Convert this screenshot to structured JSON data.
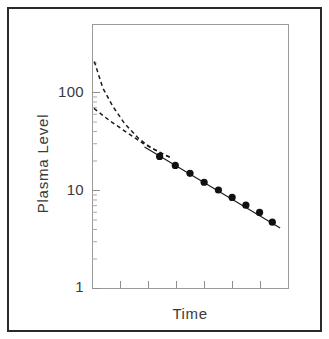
{
  "figure": {
    "border_color": "#2a2a2a",
    "background": "#ffffff"
  },
  "axis": {
    "y_tick_labels": [
      "100",
      "10",
      "1"
    ],
    "y_title": "Plasma  Level",
    "x_title": "Time"
  },
  "chart_data": {
    "type": "line",
    "title": "",
    "subtitle": "",
    "xlabel": "Time",
    "ylabel": "Plasma  Level",
    "xscale": "linear",
    "yscale": "log",
    "ylim": [
      1,
      300
    ],
    "xlim": [
      0,
      1
    ],
    "y_tick_labels": [
      "1",
      "10",
      "100"
    ],
    "y_ticks": [
      1,
      10,
      100
    ],
    "y_minor_ticks": [
      2,
      3,
      4,
      5,
      6,
      7,
      8,
      9,
      20,
      30,
      40,
      50,
      60,
      70,
      80,
      90,
      200
    ],
    "x_ticks": [
      0.143,
      0.286,
      0.429,
      0.571,
      0.714,
      0.857
    ],
    "x_tick_labels": [
      "",
      "",
      "",
      "",
      "",
      ""
    ],
    "grid": false,
    "legend": null,
    "series": [
      {
        "name": "Observed plasma concentration",
        "type": "scatter",
        "marker": "filled-circle",
        "color": "#111111",
        "x": [
          0.345,
          0.425,
          0.5,
          0.572,
          0.645,
          0.715,
          0.785,
          0.855,
          0.92
        ],
        "values": [
          22.0,
          17.8,
          14.8,
          12.0,
          10.0,
          8.4,
          7.0,
          5.9,
          4.7
        ]
      },
      {
        "name": "Terminal elimination phase (fitted line)",
        "type": "line",
        "style": "solid",
        "color": "#1a1a1a",
        "x": [
          0.268,
          0.96
        ],
        "values": [
          27.5,
          4.1
        ]
      },
      {
        "name": "Residual curve - distribution phase (steep)",
        "type": "line",
        "style": "dashed",
        "color": "#1a1a1a",
        "x": [
          0.012,
          0.055,
          0.105,
          0.165,
          0.235,
          0.3,
          0.36,
          0.41
        ],
        "values": [
          205.0,
          110.0,
          72.0,
          48.0,
          34.0,
          27.0,
          23.5,
          21.0
        ]
      },
      {
        "name": "Residual curve - absorption phase (shallow)",
        "type": "line",
        "style": "dashed",
        "color": "#1a1a1a",
        "x": [
          0.01,
          0.09,
          0.175,
          0.26,
          0.34,
          0.41
        ],
        "values": [
          68.0,
          51.0,
          39.0,
          30.0,
          24.5,
          21.0
        ]
      }
    ],
    "annotations": []
  }
}
